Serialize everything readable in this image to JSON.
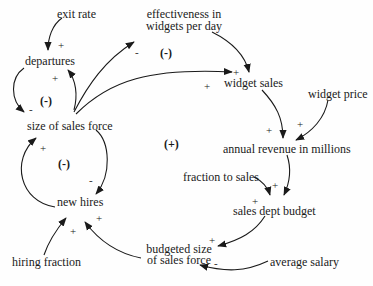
{
  "diagram": {
    "type": "causal-loop-diagram",
    "nodes": {
      "exit_rate": "exit rate",
      "departures": "departures",
      "size_of_sales_force": "size of sales force",
      "new_hires": "new hires",
      "hiring_fraction": "hiring fraction",
      "effectiveness_line1": "effectiveness in",
      "effectiveness_line2": "widgets per day",
      "widget_sales": "widget sales",
      "widget_price": "widget price",
      "annual_revenue": "annual revenue in millions",
      "fraction_to_sales": "fraction to sales",
      "sales_dept_budget": "sales dept budget",
      "budgeted_size_line1": "budgeted size",
      "budgeted_size_line2": "of sales force",
      "average_salary": "average salary"
    },
    "loops": {
      "departures_loop": "(-)",
      "effectiveness_loop": "(-)",
      "hiring_loop": "(-)",
      "revenue_loop": "(+)"
    },
    "edges": [
      {
        "from": "exit rate",
        "to": "departures",
        "polarity": "+"
      },
      {
        "from": "size of sales force",
        "to": "departures",
        "polarity": "+"
      },
      {
        "from": "departures",
        "to": "size of sales force",
        "polarity": "-"
      },
      {
        "from": "size of sales force",
        "to": "effectiveness in widgets per day",
        "polarity": "-"
      },
      {
        "from": "size of sales force",
        "to": "widget sales",
        "polarity": "+"
      },
      {
        "from": "effectiveness in widgets per day",
        "to": "widget sales",
        "polarity": "+"
      },
      {
        "from": "widget sales",
        "to": "annual revenue in millions",
        "polarity": "+"
      },
      {
        "from": "widget price",
        "to": "annual revenue in millions",
        "polarity": "+"
      },
      {
        "from": "annual revenue in millions",
        "to": "sales dept budget",
        "polarity": "+"
      },
      {
        "from": "fraction to sales",
        "to": "sales dept budget",
        "polarity": "+"
      },
      {
        "from": "sales dept budget",
        "to": "budgeted size of sales force",
        "polarity": "+"
      },
      {
        "from": "average salary",
        "to": "budgeted size of sales force",
        "polarity": "-"
      },
      {
        "from": "budgeted size of sales force",
        "to": "new hires",
        "polarity": "+"
      },
      {
        "from": "hiring fraction",
        "to": "new hires",
        "polarity": "+"
      },
      {
        "from": "size of sales force",
        "to": "new hires",
        "polarity": "-"
      },
      {
        "from": "new hires",
        "to": "size of sales force",
        "polarity": "+"
      }
    ],
    "polarity_labels": {
      "p1": "+",
      "p2": "+",
      "p3": "-",
      "p4": "-",
      "p5": "+",
      "p6": "+",
      "p7": "+",
      "p8": "+",
      "p9": "+",
      "p10": "+",
      "p11": "+",
      "p12": "-",
      "p13": "+",
      "p14": "+",
      "p15": "-",
      "p16": "+"
    },
    "colors": {
      "line": "#1a1a1a",
      "text": "#1a1a1a",
      "background": "#fefefe"
    }
  }
}
